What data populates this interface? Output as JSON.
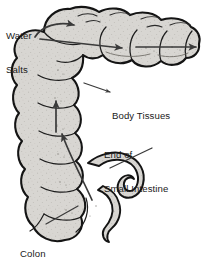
{
  "figure": {
    "background_color": "#ffffff",
    "organ_fill_color": "#d8d6d2",
    "organ_outline_color": "#1a1a1a",
    "arrow_color": "#3a3a3a",
    "text_color": "#1a1a1a"
  },
  "labels": {
    "water_salts": {
      "line1": "Water",
      "line2": "Salts",
      "full": "Water Salts"
    },
    "body_tissues": {
      "line1": "Body Tissues",
      "full": "Body Tissues"
    },
    "end_of_small_intestine": {
      "line1": "End of",
      "line2": "Small Intestine",
      "full": "End of Small Intestine"
    },
    "colon": {
      "line1": "Colon",
      "full": "Colon"
    }
  },
  "annotations": [
    {
      "name": "water-salts-flow-arrow",
      "description": "Curved arrow from Water Salts label sweeping right across the transverse colon",
      "direction": "right"
    },
    {
      "name": "transverse-flow-arrow",
      "description": "Straight arrow across the transverse colon pointing right",
      "direction": "right"
    },
    {
      "name": "body-tissues-exit-arrow",
      "description": "Arrow exiting the colon to the right toward the body tissues",
      "direction": "right"
    },
    {
      "name": "body-tissues-leader-arrow",
      "description": "Leader line with arrowhead pointing from the Body Tissues label into the colon wall",
      "direction": "right"
    },
    {
      "name": "ascending-flow-arrow",
      "description": "Arrow inside the ascending colon pointing upward",
      "direction": "up"
    },
    {
      "name": "cecum-flow-arrow",
      "description": "Long curved arrow running from the cecum up the ascending colon",
      "direction": "up-left"
    },
    {
      "name": "end-small-intestine-leader",
      "description": "Leader line from End of Small Intestine label to the ileum",
      "direction": "down-left"
    },
    {
      "name": "colon-leader",
      "description": "Leader line from Colon label to the cecum region",
      "direction": "up-right"
    }
  ],
  "anatomy_parts": [
    {
      "name": "transverse-colon"
    },
    {
      "name": "ascending-colon"
    },
    {
      "name": "cecum"
    },
    {
      "name": "ileum"
    },
    {
      "name": "appendix"
    }
  ]
}
